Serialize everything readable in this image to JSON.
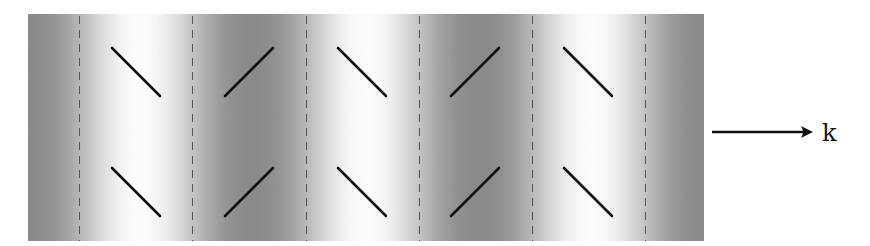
{
  "diagram": {
    "title": "",
    "panel": {
      "x": 28,
      "y": 14,
      "width": 676,
      "height": 227,
      "background_dark": "#8c8c8c",
      "background_light": "#ffffff",
      "gradient_period_px": 226,
      "gradient_stops": [
        {
          "x": 28,
          "tone": "dark"
        },
        {
          "x": 140,
          "tone": "light"
        },
        {
          "x": 253,
          "tone": "dark"
        },
        {
          "x": 366,
          "tone": "light"
        },
        {
          "x": 479,
          "tone": "dark"
        },
        {
          "x": 592,
          "tone": "light"
        },
        {
          "x": 704,
          "tone": "dark"
        }
      ]
    },
    "dashed_lines": {
      "color": "#555555",
      "dash": "8 6",
      "width": 1,
      "x_positions": [
        79,
        192,
        306,
        419,
        532,
        645
      ]
    },
    "sticks": {
      "color": "#111111",
      "width": 2.6,
      "rows": [
        {
          "y_top": 48,
          "y_bottom": 96
        },
        {
          "y_top": 168,
          "y_bottom": 216
        }
      ],
      "columns": [
        {
          "x_start": 112,
          "orientation": "backslash"
        },
        {
          "x_start": 225,
          "orientation": "slash"
        },
        {
          "x_start": 338,
          "orientation": "backslash"
        },
        {
          "x_start": 451,
          "orientation": "slash"
        },
        {
          "x_start": 564,
          "orientation": "backslash"
        }
      ],
      "length_x": 48
    },
    "arrow": {
      "x1": 712,
      "x2": 813,
      "y": 132,
      "color": "#111111",
      "label": "k"
    }
  }
}
